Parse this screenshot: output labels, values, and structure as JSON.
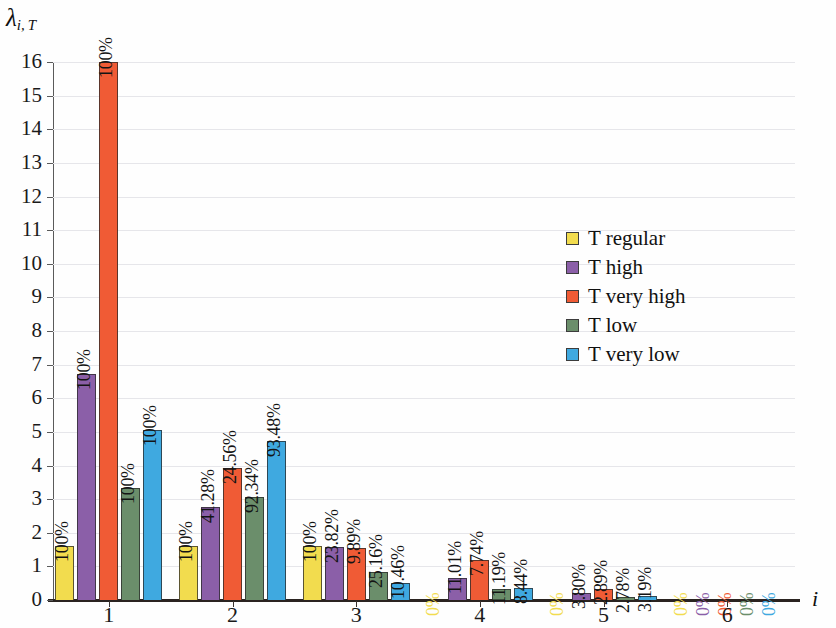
{
  "chart_data": {
    "type": "bar",
    "title": "",
    "subtitle": "",
    "xlabel": "i",
    "ylabel": "λ",
    "ylabel_sub": "i, T",
    "categories": [
      "1",
      "2",
      "3",
      "4",
      "5",
      "6"
    ],
    "ylim": [
      0,
      16
    ],
    "ytick_step": 1,
    "yticks": [
      "0",
      "1",
      "2",
      "3",
      "4",
      "5",
      "6",
      "7",
      "8",
      "9",
      "10",
      "11",
      "12",
      "13",
      "14",
      "15",
      "16"
    ],
    "grid": true,
    "legend_position": "inside-right",
    "series": [
      {
        "name": "T regular",
        "color": "#F2DC4E",
        "values": [
          1.6,
          1.6,
          1.6,
          0.0,
          0.0,
          0.0
        ],
        "labels": [
          "100%",
          "100%",
          "100%",
          "0%",
          "0%",
          "0%"
        ]
      },
      {
        "name": "T high",
        "color": "#8B5FA8",
        "values": [
          6.72,
          2.78,
          1.58,
          0.66,
          0.2,
          0.0
        ],
        "labels": [
          "100%",
          "41.28%",
          "23.82%",
          "11.01%",
          "3.80%",
          "0%"
        ]
      },
      {
        "name": "T very high",
        "color": "#F05B35",
        "values": [
          16.0,
          3.93,
          1.55,
          1.18,
          0.33,
          0.0
        ],
        "labels": [
          "100%",
          "24.56%",
          "9.89%",
          "7.74%",
          "2.89%",
          "0%"
        ]
      },
      {
        "name": "T low",
        "color": "#6B8E6B",
        "values": [
          3.33,
          3.05,
          0.83,
          0.34,
          0.09,
          0.0
        ],
        "labels": [
          "100%",
          "92.34%",
          "25.16%",
          "11.19%",
          "2.78%",
          "0%"
        ]
      },
      {
        "name": "T very low",
        "color": "#3FA9E0",
        "values": [
          5.05,
          4.73,
          0.52,
          0.36,
          0.11,
          0.0
        ],
        "labels": [
          "100%",
          "93.48%",
          "10.46%",
          "8.44%",
          "3.19%",
          "0%"
        ]
      }
    ]
  },
  "legend": {
    "items": [
      {
        "label": "T regular",
        "color": "#F2DC4E"
      },
      {
        "label": "T high",
        "color": "#8B5FA8"
      },
      {
        "label": "T very high",
        "color": "#F05B35"
      },
      {
        "label": "T low",
        "color": "#6B8E6B"
      },
      {
        "label": "T very low",
        "color": "#3FA9E0"
      }
    ]
  }
}
